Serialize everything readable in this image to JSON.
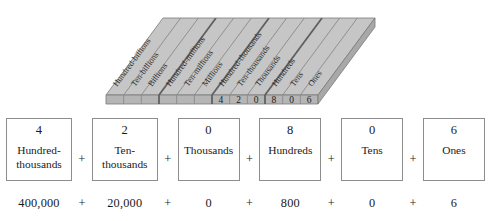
{
  "figure": {
    "name": "place-value-chart",
    "colors": {
      "top_face": "#c6c6c6",
      "front_face": "#b5b5b5",
      "right_face": "#a8a8a8",
      "rule_line": "#8a8a8a",
      "strong_rule": "#6f6f6f",
      "outline": "#7a7a7a"
    },
    "column_labels": [
      "Hundred-billions",
      "Ten-billions",
      "Billions",
      "Hundred-millions",
      "Ten-millions",
      "Millions",
      "Hundred-thousands",
      "Ten-thousands",
      "Thousands",
      "Hundreds",
      "Tens",
      "Ones"
    ],
    "cell_digits": [
      "",
      "",
      "",
      "",
      "",
      "",
      "4",
      "2",
      "0",
      "8",
      "0",
      "6"
    ]
  },
  "expanded_form": {
    "plus": "+",
    "terms": [
      {
        "digit": "4",
        "place": "Hundred-thousands",
        "value": "400,000"
      },
      {
        "digit": "2",
        "place": "Ten-thousands",
        "value": "20,000"
      },
      {
        "digit": "0",
        "place": "Thousands",
        "value": "0"
      },
      {
        "digit": "8",
        "place": "Hundreds",
        "value": "800"
      },
      {
        "digit": "0",
        "place": "Tens",
        "value": "0"
      },
      {
        "digit": "6",
        "place": "Ones",
        "value": "6"
      }
    ]
  }
}
